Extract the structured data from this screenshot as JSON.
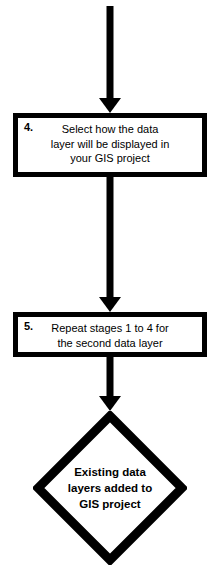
{
  "diagram": {
    "orientation": "top-to-bottom",
    "stroke_color": "#000000",
    "fill_color": "#ffffff",
    "nodes": [
      {
        "id": "arrow-top",
        "type": "arrow",
        "direction": "down"
      },
      {
        "id": "step-4",
        "type": "process",
        "number": "4.",
        "lines": [
          "Select how the data",
          "layer will be displayed in",
          "your GIS  project"
        ]
      },
      {
        "id": "arrow-middle",
        "type": "arrow",
        "direction": "down"
      },
      {
        "id": "step-5",
        "type": "process",
        "number": "5.",
        "lines": [
          "Repeat stages 1 to 4 for",
          "the  second data layer"
        ]
      },
      {
        "id": "arrow-bottom",
        "type": "arrow",
        "direction": "down"
      },
      {
        "id": "result",
        "type": "terminator-diamond",
        "lines": [
          "Existing data",
          "layers added to",
          "GIS project"
        ]
      }
    ]
  }
}
